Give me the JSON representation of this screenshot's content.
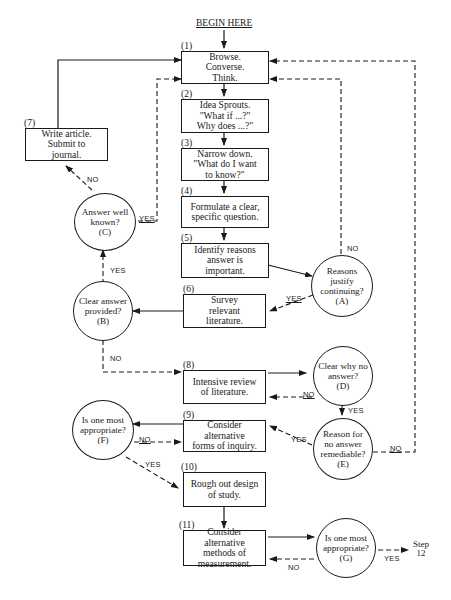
{
  "header": {
    "begin": "BEGIN HERE"
  },
  "steps": [
    {
      "num": "(1)",
      "text": "Browse.\nConverse.\nThink."
    },
    {
      "num": "(2)",
      "text": "Idea Sprouts.\n\"What if ...?\"\nWhy does ...?\""
    },
    {
      "num": "(3)",
      "text": "Narrow down.\n\"What do I want\nto know?\""
    },
    {
      "num": "(4)",
      "text": "Formulate a clear,\nspecific question."
    },
    {
      "num": "(5)",
      "text": "Identify reasons\nanswer is\nimportant."
    },
    {
      "num": "(6)",
      "text": "Survey\nrelevant\nliterature."
    },
    {
      "num": "(7)",
      "text": "Write article.\nSubmit to\njournal."
    },
    {
      "num": "(8)",
      "text": "Intensive review\nof literature."
    },
    {
      "num": "(9)",
      "text": "Consider alternative\nforms of inquiry."
    },
    {
      "num": "(10)",
      "text": "Rough out design\nof study."
    },
    {
      "num": "(11)",
      "text": "Consider alternative\nmethods of\nmeasurement."
    }
  ],
  "decisions": {
    "A": "Reasons\njustify\ncontinuing?\n(A)",
    "B": "Clear answer\nprovided?\n(B)",
    "C": "Answer well\nknown?\n(C)",
    "D": "Clear why no\nanswer?\n(D)",
    "E": "Reason for\nno answer\nremediable?\n(E)",
    "F": "Is one most\nappropriate?\n(F)",
    "G": "Is one most\nappropriate?\n(G)"
  },
  "labels": {
    "yes": "YES",
    "no": "NO",
    "end": "Step\n12"
  }
}
